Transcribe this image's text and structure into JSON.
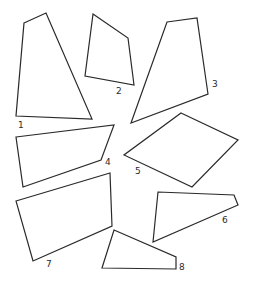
{
  "diagram": {
    "stroke_color": "#2a2a2a",
    "background": "#ffffff",
    "shapes": [
      {
        "id": "1",
        "label": "1",
        "points": [
          [
            24,
            23
          ],
          [
            46,
            13
          ],
          [
            92,
            119
          ],
          [
            16,
            116
          ]
        ],
        "label_pos": [
          18,
          128
        ]
      },
      {
        "id": "2",
        "label": "2",
        "points": [
          [
            93,
            14
          ],
          [
            128,
            38
          ],
          [
            134,
            85
          ],
          [
            85,
            76
          ]
        ],
        "label_pos": [
          116,
          94
        ]
      },
      {
        "id": "3",
        "label": "3",
        "points": [
          [
            167,
            22
          ],
          [
            197,
            18
          ],
          [
            208,
            94
          ],
          [
            131,
            123
          ]
        ],
        "label_pos": [
          212,
          87
        ]
      },
      {
        "id": "4",
        "label": "4",
        "points": [
          [
            16,
            137
          ],
          [
            114,
            125
          ],
          [
            101,
            160
          ],
          [
            23,
            187
          ]
        ],
        "label_pos": [
          105,
          165
        ]
      },
      {
        "id": "5",
        "label": "5",
        "points": [
          [
            181,
            113
          ],
          [
            238,
            140
          ],
          [
            192,
            187
          ],
          [
            124,
            155
          ]
        ],
        "label_pos": [
          135,
          174
        ]
      },
      {
        "id": "6",
        "label": "6",
        "points": [
          [
            158,
            192
          ],
          [
            234,
            195
          ],
          [
            238,
            205
          ],
          [
            153,
            242
          ]
        ],
        "label_pos": [
          222,
          223
        ]
      },
      {
        "id": "7",
        "label": "7",
        "points": [
          [
            16,
            201
          ],
          [
            110,
            173
          ],
          [
            112,
            226
          ],
          [
            33,
            261
          ]
        ],
        "label_pos": [
          46,
          267
        ]
      },
      {
        "id": "8",
        "label": "8",
        "points": [
          [
            114,
            230
          ],
          [
            176,
            257
          ],
          [
            176,
            269
          ],
          [
            102,
            268
          ]
        ],
        "label_pos": [
          179,
          270
        ]
      }
    ]
  }
}
